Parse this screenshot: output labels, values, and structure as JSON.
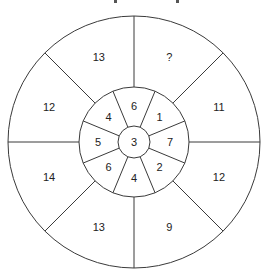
{
  "diagram": {
    "type": "number-wheel-puzzle",
    "center_value": "3",
    "inner_ring": [
      {
        "label": "6",
        "angle": 90
      },
      {
        "label": "1",
        "angle": 45
      },
      {
        "label": "7",
        "angle": 0
      },
      {
        "label": "2",
        "angle": -45
      },
      {
        "label": "4",
        "angle": -90
      },
      {
        "label": "6",
        "angle": -135
      },
      {
        "label": "5",
        "angle": 180
      },
      {
        "label": "4",
        "angle": 135
      }
    ],
    "outer_ring": [
      {
        "label": "?",
        "angle": 67.5
      },
      {
        "label": "11",
        "angle": 22.5
      },
      {
        "label": "12",
        "angle": -22.5
      },
      {
        "label": "9",
        "angle": -67.5
      },
      {
        "label": "13",
        "angle": -112.5
      },
      {
        "label": "14",
        "angle": -157.5
      },
      {
        "label": "12",
        "angle": 157.5
      },
      {
        "label": "13",
        "angle": 112.5
      }
    ],
    "line_color": "#3a3a3a"
  }
}
